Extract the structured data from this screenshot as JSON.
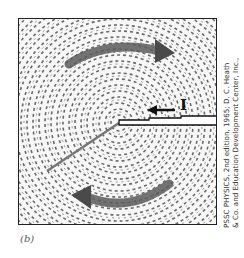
{
  "figure": {
    "panel_label": "(b)",
    "current_label": "I",
    "credit_line_1": "PSSC PHYSICS, 2nd edition, 1965; D. C. Heath",
    "credit_line_2": "& Co. and Education Development Center, Inc.,",
    "colors": {
      "frame": "#222222",
      "filings": "#555555",
      "field_arrow": "#4a4a4a",
      "wire": "#111111",
      "background": "#ffffff"
    }
  }
}
